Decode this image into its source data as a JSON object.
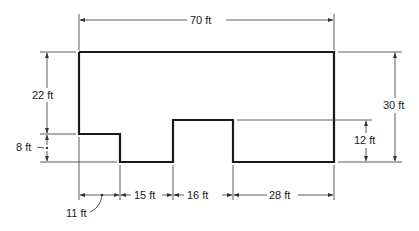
{
  "diagram": {
    "type": "floor-plan-dimensions",
    "units": "ft",
    "colors": {
      "outline": "#1a1a1a",
      "dimension": "#333333",
      "background": "#ffffff"
    },
    "dimensions": {
      "overall_width": {
        "label": "70 ft",
        "value": 70
      },
      "overall_height": {
        "label": "30 ft",
        "value": 30
      },
      "left_upper_height": {
        "label": "22 ft",
        "value": 22
      },
      "left_lower_height": {
        "label": "8 ft",
        "value": 8
      },
      "notch_height": {
        "label": "12 ft",
        "value": 12
      },
      "bottom_segment_1": {
        "label": "11 ft",
        "value": 11
      },
      "bottom_segment_2": {
        "label": "15 ft",
        "value": 15
      },
      "bottom_segment_3": {
        "label": "16 ft",
        "value": 16
      },
      "bottom_segment_4": {
        "label": "28 ft",
        "value": 28
      }
    }
  }
}
